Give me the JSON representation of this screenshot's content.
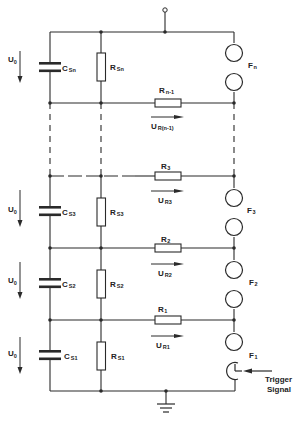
{
  "diagram": {
    "type": "circuit-schematic",
    "colors": {
      "line": "#2a2a2a",
      "background": "#ffffff"
    },
    "source_label": {
      "main": "U",
      "sub": "0"
    },
    "stages": [
      {
        "capacitor": {
          "main": "C",
          "sub": "Sn"
        },
        "shunt": {
          "main": "R",
          "sub": "Sn"
        },
        "coupling": {
          "main": "R",
          "sub": "n-1"
        },
        "voltage": {
          "main": "U",
          "sub": "R(n-1)"
        },
        "gap": {
          "main": "F",
          "sub": "n"
        }
      },
      {
        "capacitor": {
          "main": "C",
          "sub": "S3"
        },
        "shunt": {
          "main": "R",
          "sub": "S3"
        },
        "coupling": {
          "main": "R",
          "sub": "3"
        },
        "voltage": {
          "main": "U",
          "sub": "R3"
        },
        "gap": {
          "main": "F",
          "sub": "3"
        }
      },
      {
        "capacitor": {
          "main": "C",
          "sub": "S2"
        },
        "shunt": {
          "main": "R",
          "sub": "S2"
        },
        "coupling": {
          "main": "R",
          "sub": "2"
        },
        "voltage": {
          "main": "U",
          "sub": "R2"
        },
        "gap": {
          "main": "F",
          "sub": "2"
        }
      },
      {
        "capacitor": {
          "main": "C",
          "sub": "S1"
        },
        "shunt": {
          "main": "R",
          "sub": "S1"
        },
        "coupling": {
          "main": "R",
          "sub": "1"
        },
        "voltage": {
          "main": "U",
          "sub": "R1"
        },
        "gap": {
          "main": "F",
          "sub": "1"
        }
      }
    ],
    "trigger": {
      "line1": "Trigger",
      "line2": "Signal"
    }
  }
}
